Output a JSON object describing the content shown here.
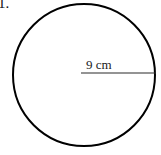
{
  "figure": {
    "type": "geometry-diagram",
    "shape": "circle",
    "background_color": "#ffffff",
    "stroke_color": "#000000",
    "item_number": "1.",
    "circle": {
      "center_x": 84,
      "center_y": 75,
      "radius_px": 71,
      "stroke_width": 2
    },
    "radius_line": {
      "label": "9 cm",
      "value": 9,
      "unit": "cm",
      "measures": "radius",
      "x_start": 81,
      "x_end": 155,
      "y": 73,
      "stroke_width": 1,
      "stroke_color": "#2b2b2b"
    }
  }
}
